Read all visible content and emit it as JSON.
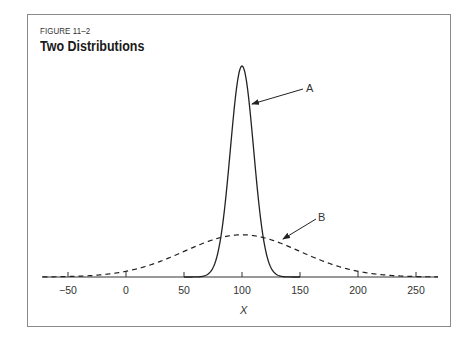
{
  "figure": {
    "label": "FIGURE 11–2",
    "title": "Two Distributions"
  },
  "chart_data": {
    "type": "line",
    "title": "Two Distributions",
    "subtitle": "FIGURE 11–2",
    "xlabel": "X",
    "ylabel": "",
    "xlim": [
      -72,
      269
    ],
    "x_ticks": [
      -50,
      0,
      50,
      100,
      150,
      200,
      250
    ],
    "x_tick_labels": [
      "−50",
      "0",
      "50",
      "100",
      "150",
      "200",
      "250"
    ],
    "grid": false,
    "legend": null,
    "series": [
      {
        "name": "A",
        "style": "solid",
        "distribution": "normal",
        "mean": 100,
        "sd": 10,
        "x_range": [
          50,
          150
        ],
        "x": [
          50,
          70,
          80,
          85,
          90,
          95,
          100,
          105,
          110,
          115,
          120,
          130,
          150
        ],
        "relative_height": [
          0.0,
          0.011,
          0.135,
          0.325,
          0.607,
          0.882,
          1.0,
          0.882,
          0.607,
          0.325,
          0.135,
          0.011,
          0.0
        ]
      },
      {
        "name": "B",
        "style": "dashed",
        "distribution": "normal",
        "mean": 100,
        "sd": 50,
        "x_range": [
          -72,
          269
        ],
        "x": [
          -72,
          -50,
          0,
          50,
          100,
          150,
          200,
          250,
          269
        ],
        "relative_height": [
          0.003,
          0.011,
          0.027,
          0.121,
          0.2,
          0.121,
          0.027,
          0.002,
          0.001
        ]
      }
    ],
    "annotations": [
      {
        "text": "A",
        "points_to": "solid curve right flank near x≈108"
      },
      {
        "text": "B",
        "points_to": "dashed curve near x≈135"
      }
    ]
  },
  "annotations": {
    "a": "A",
    "b": "B"
  },
  "axis": {
    "x_label": "X",
    "ticks": [
      {
        "value": -50,
        "label": "−50"
      },
      {
        "value": 0,
        "label": "0"
      },
      {
        "value": 50,
        "label": "50"
      },
      {
        "value": 100,
        "label": "100"
      },
      {
        "value": 150,
        "label": "150"
      },
      {
        "value": 200,
        "label": "200"
      },
      {
        "value": 250,
        "label": "250"
      }
    ]
  }
}
